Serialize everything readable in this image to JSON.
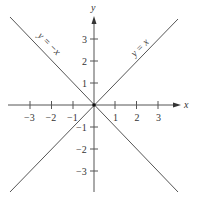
{
  "diagram": {
    "type": "coordinate-plane",
    "axes": {
      "x_label": "x",
      "y_label": "y",
      "x_ticks": [
        "−3",
        "−2",
        "−1",
        "1",
        "2",
        "3"
      ],
      "y_ticks_positive": [
        "3",
        "2",
        "1"
      ],
      "y_ticks_negative": [
        "−1",
        "−2",
        "−3"
      ]
    },
    "lines": [
      {
        "label": "y = x",
        "slope": 1
      },
      {
        "label": "y = −x",
        "slope": -1
      }
    ],
    "colors": {
      "axis": "#555555",
      "line": "#555555",
      "text": "#333333"
    }
  }
}
